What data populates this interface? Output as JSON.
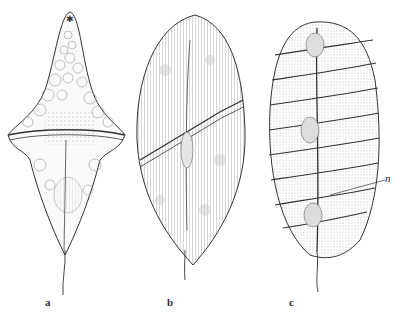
{
  "figure": {
    "panels": [
      {
        "id": "a",
        "label": "a",
        "description": "Dinoflagellate with pointed apical horn, vacuoles and granular center"
      },
      {
        "id": "b",
        "label": "b",
        "description": "Ovoid striated dinoflagellate with spiral girdle"
      },
      {
        "id": "c",
        "label": "c",
        "description": "Elongate multi-girdled dinoflagellate (polykrikos-like)"
      }
    ],
    "annotation": "n",
    "colors": {
      "ink": "#2a2a2a",
      "paper": "#ffffff",
      "stipple": "#9a9a9a"
    }
  }
}
